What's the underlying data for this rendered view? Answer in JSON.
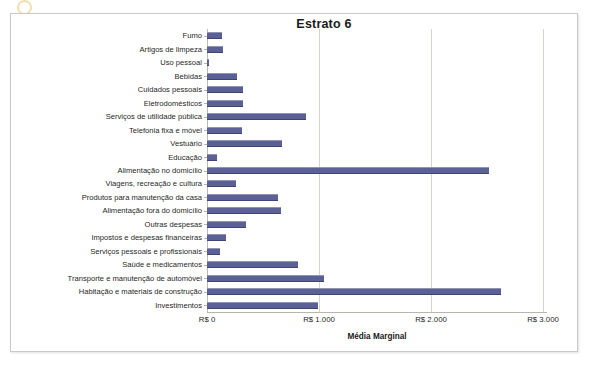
{
  "chart_data": {
    "type": "bar",
    "orientation": "horizontal",
    "title": "Estrato 6",
    "xlabel": "Média Marginal",
    "ylabel": "",
    "xlim": [
      0,
      3000
    ],
    "xticks": [
      0,
      1000,
      2000,
      3000
    ],
    "xtick_labels": [
      "R$ 0",
      "R$ 1.000",
      "R$ 2.000",
      "R$ 3.000"
    ],
    "grid": true,
    "grid_axis": "x",
    "legend": false,
    "bar_color": "#5b6194",
    "currency_prefix": "R$",
    "categories": [
      "Fumo",
      "Artigos de limpeza",
      "Uso pessoal",
      "Bebidas",
      "Cuidados pessoais",
      "Eletrodomésticos",
      "Serviços de utilidade pública",
      "Telefonia fixa e móvel",
      "Vestuário",
      "Educação",
      "Alimentação no domicílio",
      "Viagens, recreação e cultura",
      "Produtos para manutenção da casa",
      "Alimentação fora do domicílio",
      "Outras despesas",
      "Impostos e despesas financeiras",
      "Serviços pessoais e profissionais",
      "Saúde e medicamentos",
      "Transporte e manutenção de automóvel",
      "Habitação e materiais de construção",
      "Investimentos"
    ],
    "values": [
      135,
      140,
      12,
      270,
      325,
      320,
      885,
      310,
      670,
      90,
      2520,
      260,
      635,
      660,
      350,
      170,
      115,
      810,
      1045,
      2625,
      990
    ],
    "series": [
      {
        "name": "Média Marginal",
        "values": [
          135,
          140,
          12,
          270,
          325,
          320,
          885,
          310,
          670,
          90,
          2520,
          260,
          635,
          660,
          350,
          170,
          115,
          810,
          1045,
          2625,
          990
        ]
      }
    ]
  }
}
